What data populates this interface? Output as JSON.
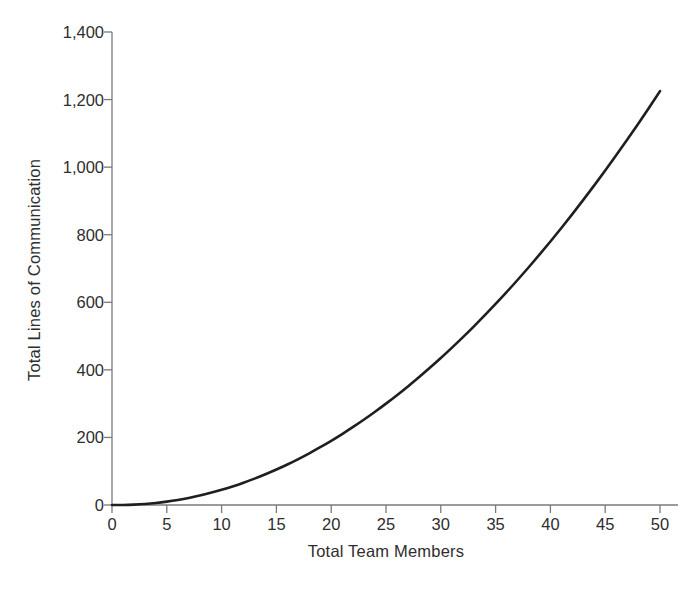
{
  "chart_data": {
    "type": "line",
    "title": "",
    "xlabel": "Total Team Members",
    "ylabel": "Total Lines of Communication",
    "xlim": [
      0,
      50
    ],
    "ylim": [
      0,
      1400
    ],
    "xticks": [
      "0",
      "5",
      "10",
      "15",
      "20",
      "25",
      "30",
      "35",
      "40",
      "45",
      "50"
    ],
    "xtick_values": [
      0,
      5,
      10,
      15,
      20,
      25,
      30,
      35,
      40,
      45,
      50
    ],
    "yticks": [
      "0",
      "200",
      "400",
      "600",
      "800",
      "1,000",
      "1,200",
      "1,400"
    ],
    "ytick_values": [
      0,
      200,
      400,
      600,
      800,
      1000,
      1200,
      1400
    ],
    "grid": false,
    "legend": false,
    "legend_position": "none",
    "series": [
      {
        "name": "Total Lines of Communication",
        "formula": "n(n-1)/2",
        "color": "#1f1f1f",
        "line_width": 2.6,
        "x": [
          0,
          1,
          2,
          3,
          4,
          5,
          6,
          7,
          8,
          9,
          10,
          11,
          12,
          13,
          14,
          15,
          16,
          17,
          18,
          19,
          20,
          21,
          22,
          23,
          24,
          25,
          26,
          27,
          28,
          29,
          30,
          31,
          32,
          33,
          34,
          35,
          36,
          37,
          38,
          39,
          40,
          41,
          42,
          43,
          44,
          45,
          46,
          47,
          48,
          49,
          50
        ],
        "values": [
          0,
          0,
          1,
          3,
          6,
          10,
          15,
          21,
          28,
          36,
          45,
          55,
          66,
          78,
          91,
          105,
          120,
          136,
          153,
          171,
          190,
          210,
          231,
          253,
          276,
          300,
          325,
          351,
          378,
          406,
          435,
          465,
          496,
          528,
          561,
          595,
          630,
          666,
          703,
          741,
          780,
          820,
          861,
          903,
          946,
          990,
          1035,
          1081,
          1128,
          1176,
          1225
        ]
      }
    ]
  },
  "axes": {
    "x_title": "Total Team Members",
    "y_title": "Total Lines of Communication"
  },
  "colors": {
    "curve": "#1f1f1f",
    "axis": "#7a7a7a",
    "text": "#2e2e2e",
    "background": "#ffffff"
  }
}
